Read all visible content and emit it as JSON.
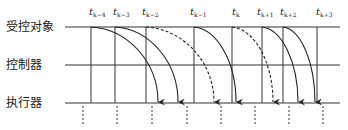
{
  "rows": [
    {
      "id": "plant",
      "label": "受控对象"
    },
    {
      "id": "controller",
      "label": "控制器"
    },
    {
      "id": "actuator",
      "label": "执行器"
    }
  ],
  "time_labels": [
    {
      "base": "t",
      "sub": "k−4"
    },
    {
      "base": "t",
      "sub": "k−3"
    },
    {
      "base": "t",
      "sub": "k−2"
    },
    {
      "base": "t",
      "sub": "k−1"
    },
    {
      "base": "t",
      "sub": "k"
    },
    {
      "base": "t",
      "sub": "k+1"
    },
    {
      "base": "t",
      "sub": "k+2"
    },
    {
      "base": "t",
      "sub": "k+3"
    }
  ],
  "arrows": [
    {
      "from": "t_{k-4}",
      "style": "solid"
    },
    {
      "from": "t_{k-3}",
      "style": "solid"
    },
    {
      "from": "t_{k-2}",
      "style": "dashed"
    },
    {
      "from": "t_{k-1}",
      "style": "solid"
    },
    {
      "from": "t_k",
      "style": "dashed"
    },
    {
      "from": "t_{k+1}",
      "style": "solid"
    },
    {
      "from": "t_{k+2}",
      "style": "solid"
    }
  ],
  "colors": {
    "line": "#333333",
    "text": "#222222",
    "background": "#ffffff"
  }
}
